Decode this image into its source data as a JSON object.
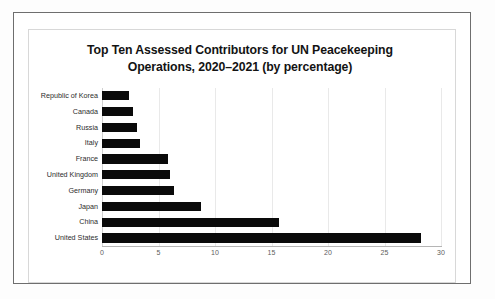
{
  "chart_data": {
    "type": "bar",
    "orientation": "horizontal",
    "title": "Top Ten Assessed Contributors for UN Peacekeeping Operations, 2020–2021 (by percentage)",
    "title_line1": "Top Ten Assessed Contributors for UN Peacekeeping",
    "title_line2": "Operations, 2020–2021 (by percentage)",
    "xlabel": "",
    "ylabel": "",
    "xlim": [
      0,
      30
    ],
    "xticks": [
      "0",
      "5",
      "10",
      "15",
      "20",
      "25",
      "30"
    ],
    "xtick_values": [
      0,
      5,
      10,
      15,
      20,
      25,
      30
    ],
    "grid": "vertical",
    "legend": "none",
    "bar_color": "#0a0a0a",
    "categories": [
      "Republic of Korea",
      "Canada",
      "Russia",
      "Italy",
      "France",
      "United Kingdom",
      "Germany",
      "Japan",
      "China",
      "United States"
    ],
    "values": [
      2.4,
      2.7,
      3.1,
      3.4,
      5.8,
      6.0,
      6.4,
      8.8,
      15.7,
      28.2
    ]
  }
}
